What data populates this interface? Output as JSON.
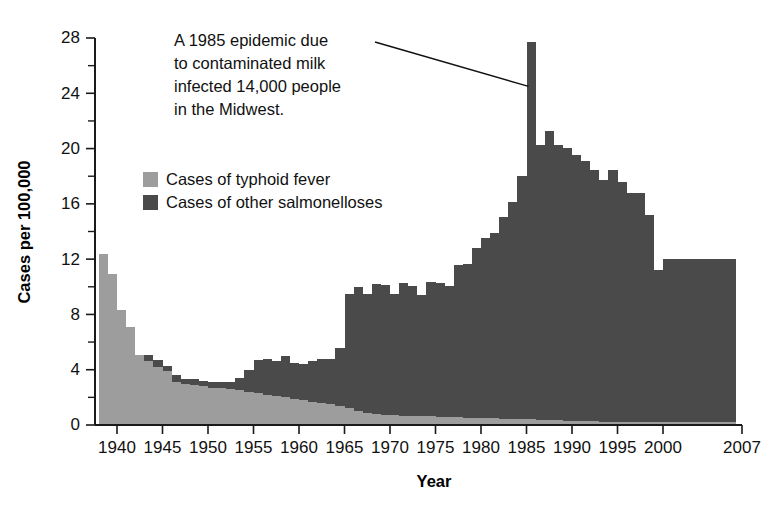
{
  "chart_data": {
    "type": "area",
    "title": "",
    "xlabel": "Year",
    "ylabel": "Cases per 100,000",
    "xlim": [
      1938,
      2007
    ],
    "ylim": [
      0,
      28
    ],
    "grid": false,
    "stacked": true,
    "legend_position": "upper-left-inside",
    "x_ticks": [
      "1940",
      "1945",
      "1950",
      "1955",
      "1960",
      "1965",
      "1970",
      "1975",
      "1980",
      "1985",
      "1990",
      "1995",
      "2000",
      "2007"
    ],
    "x_tick_values": [
      1940,
      1945,
      1950,
      1955,
      1960,
      1965,
      1970,
      1975,
      1980,
      1985,
      1990,
      1995,
      2000,
      2007
    ],
    "y_ticks": [
      "0",
      "4",
      "8",
      "12",
      "16",
      "20",
      "24",
      "28"
    ],
    "y_tick_values": [
      0,
      4,
      8,
      12,
      16,
      20,
      24,
      28
    ],
    "y_minor_tick_values": [
      2,
      6,
      10,
      14,
      18,
      22,
      26
    ],
    "colors": {
      "typhoid": "#9d9d9d",
      "salmonelloses": "#4a4a4a",
      "axis": "#1a1a1a",
      "text": "#111111"
    },
    "x": [
      1938,
      1939,
      1940,
      1941,
      1942,
      1943,
      1944,
      1945,
      1946,
      1947,
      1948,
      1949,
      1950,
      1951,
      1952,
      1953,
      1954,
      1955,
      1956,
      1957,
      1958,
      1959,
      1960,
      1961,
      1962,
      1963,
      1964,
      1965,
      1966,
      1967,
      1968,
      1969,
      1970,
      1971,
      1972,
      1973,
      1974,
      1975,
      1976,
      1977,
      1978,
      1979,
      1980,
      1981,
      1982,
      1983,
      1984,
      1985,
      1986,
      1987,
      1988,
      1989,
      1990,
      1991,
      1992,
      1993,
      1994,
      1995,
      1996,
      1997,
      1998,
      1999,
      2000,
      2007
    ],
    "series": [
      {
        "name": "Cases of typhoid fever",
        "color": "#9d9d9d",
        "values": [
          12.4,
          10.9,
          8.3,
          7.1,
          5.1,
          4.6,
          4.2,
          3.9,
          3.1,
          3.0,
          2.9,
          2.8,
          2.7,
          2.7,
          2.6,
          2.5,
          2.4,
          2.3,
          2.2,
          2.1,
          2.0,
          1.9,
          1.8,
          1.7,
          1.6,
          1.5,
          1.4,
          1.2,
          1.0,
          0.9,
          0.8,
          0.75,
          0.7,
          0.68,
          0.66,
          0.64,
          0.62,
          0.6,
          0.58,
          0.56,
          0.54,
          0.52,
          0.5,
          0.48,
          0.46,
          0.44,
          0.42,
          0.4,
          0.38,
          0.36,
          0.34,
          0.32,
          0.3,
          0.28,
          0.26,
          0.24,
          0.22,
          0.2,
          0.2,
          0.2,
          0.2,
          0.2,
          0.2,
          0.2
        ]
      },
      {
        "name": "Cases of other salmonelloses",
        "color": "#4a4a4a",
        "values": [
          0.0,
          0.0,
          0.0,
          0.0,
          0.0,
          0.5,
          0.5,
          0.4,
          0.5,
          0.3,
          0.4,
          0.4,
          0.4,
          0.4,
          0.5,
          0.9,
          1.6,
          2.4,
          2.6,
          2.5,
          3.0,
          2.6,
          2.6,
          2.9,
          3.2,
          3.3,
          4.2,
          8.3,
          9.0,
          8.6,
          9.4,
          9.4,
          8.8,
          9.6,
          9.4,
          8.8,
          9.7,
          9.7,
          9.5,
          11.0,
          11.1,
          12.3,
          13.0,
          13.4,
          14.6,
          15.7,
          17.6,
          27.3,
          19.9,
          20.9,
          19.9,
          19.7,
          19.2,
          18.8,
          18.2,
          17.5,
          18.2,
          17.4,
          16.6,
          16.6,
          15.0,
          11.0,
          11.8,
          11.8
        ]
      }
    ],
    "annotation": {
      "text_lines": [
        "A 1985 epidemic due",
        "to contaminated milk",
        "infected 14,000 people",
        "in the Midwest."
      ],
      "points_to_year": 1985,
      "points_to_value": 24.5
    }
  },
  "legend": {
    "items": [
      {
        "label": "Cases of typhoid fever",
        "color": "#9d9d9d"
      },
      {
        "label": "Cases of other salmonelloses",
        "color": "#4a4a4a"
      }
    ]
  }
}
